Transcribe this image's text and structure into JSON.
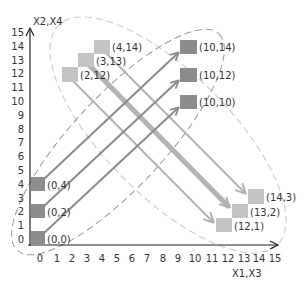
{
  "diagram": {
    "type": "coordinate-mapping",
    "axes": {
      "x_label": "X1,X3",
      "y_label": "X2,X4",
      "x_ticks": [
        "0",
        "1",
        "2",
        "3",
        "4",
        "5",
        "6",
        "7",
        "8",
        "9",
        "10",
        "11",
        "12",
        "13",
        "14",
        "15"
      ],
      "y_ticks": [
        "0",
        "1",
        "2",
        "3",
        "4",
        "5",
        "6",
        "7",
        "8",
        "9",
        "10",
        "11",
        "12",
        "13",
        "14",
        "15"
      ]
    },
    "groups": [
      {
        "name": "source-left",
        "color": "#8c8c8c",
        "points": [
          {
            "label": "(0,0)",
            "x": 0,
            "y": 0
          },
          {
            "label": "(0,2)",
            "x": 0,
            "y": 2
          },
          {
            "label": "(0,4)",
            "x": 0,
            "y": 4
          }
        ]
      },
      {
        "name": "target-right-up",
        "color": "#8c8c8c",
        "points": [
          {
            "label": "(10,10)",
            "x": 10,
            "y": 10
          },
          {
            "label": "(10,12)",
            "x": 10,
            "y": 12
          },
          {
            "label": "(10,14)",
            "x": 10,
            "y": 14
          }
        ]
      },
      {
        "name": "source-top",
        "color": "#c4c4c4",
        "points": [
          {
            "label": "(2,12)",
            "x": 2,
            "y": 12
          },
          {
            "label": "(3,13)",
            "x": 3,
            "y": 13
          },
          {
            "label": "(4,14)",
            "x": 4,
            "y": 14
          }
        ]
      },
      {
        "name": "target-bottom-right",
        "color": "#c4c4c4",
        "points": [
          {
            "label": "(12,1)",
            "x": 12,
            "y": 1
          },
          {
            "label": "(13,2)",
            "x": 13,
            "y": 2
          },
          {
            "label": "(14,3)",
            "x": 14,
            "y": 3
          }
        ]
      }
    ],
    "arrows": [
      {
        "from": "(0,0)",
        "to": "(10,10)",
        "color": "#8c8c8c"
      },
      {
        "from": "(0,2)",
        "to": "(10,12)",
        "color": "#8c8c8c"
      },
      {
        "from": "(0,4)",
        "to": "(10,14)",
        "color": "#8c8c8c"
      },
      {
        "from": "(2,12)",
        "to": "(12,1)",
        "color": "#b4b4b4"
      },
      {
        "from": "(3,13)",
        "to": "(13,2)",
        "color": "#b4b4b4",
        "thick": true
      },
      {
        "from": "(4,14)",
        "to": "(14,3)",
        "color": "#b4b4b4"
      }
    ],
    "ellipses": [
      {
        "name": "rising-cluster",
        "style": "dashed",
        "color": "#9a9a9a"
      },
      {
        "name": "falling-cluster",
        "style": "dashed",
        "color": "#cfcfcf"
      }
    ]
  }
}
